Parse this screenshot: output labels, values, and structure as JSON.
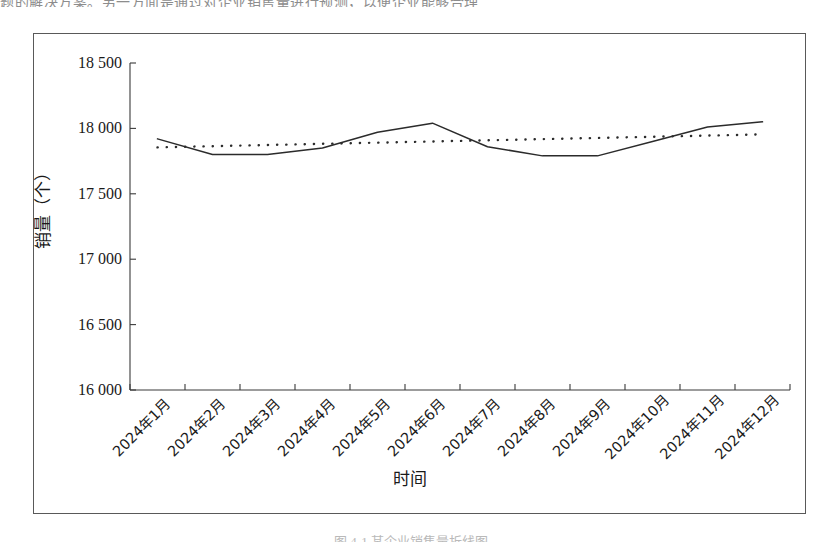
{
  "page": {
    "top_clipped_text": "题的解决方案。另一方面是通过对企业销售量进行预测，以便企业能够合理",
    "bottom_clipped_caption": "图 4-1    某企业销售量折线图"
  },
  "chart_data": {
    "type": "line",
    "title": "",
    "xlabel": "时间",
    "ylabel": "销量（个）",
    "categories": [
      "2024年1月",
      "2024年2月",
      "2024年3月",
      "2024年4月",
      "2024年5月",
      "2024年6月",
      "2024年7月",
      "2024年8月",
      "2024年9月",
      "2024年10月",
      "2024年11月",
      "2024年12月"
    ],
    "ylim": [
      16000,
      18500
    ],
    "ytick_values": [
      16000,
      16500,
      17000,
      17500,
      18000,
      18500
    ],
    "ytick_labels": [
      "16 000",
      "16 500",
      "17 000",
      "17 500",
      "18 000",
      "18 500"
    ],
    "grid": false,
    "legend": "none",
    "series": [
      {
        "name": "销量",
        "style": "solid",
        "color": "#2b2b2b",
        "values": [
          17920,
          17800,
          17800,
          17850,
          17970,
          18040,
          17860,
          17790,
          17790,
          17900,
          18010,
          18050
        ]
      },
      {
        "name": "趋势线",
        "style": "dotted",
        "color": "#2b2b2b",
        "values": [
          17855,
          17864,
          17873,
          17882,
          17891,
          17900,
          17909,
          17918,
          17927,
          17936,
          17945,
          17954
        ]
      }
    ]
  },
  "axis": {
    "y_title": "销量（个）",
    "x_title": "时间"
  }
}
